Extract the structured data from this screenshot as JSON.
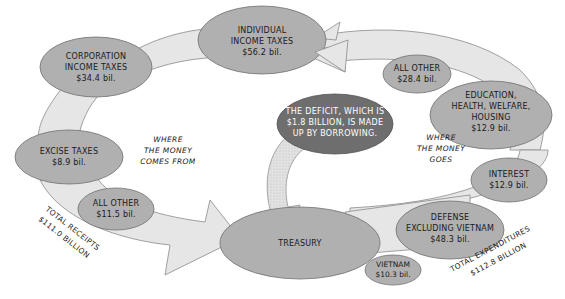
{
  "diagram": {
    "type": "flow",
    "colors": {
      "ring": "#e6e6e6",
      "ring_stroke": "#8a8a8a",
      "node_fill": "#b0b0b0",
      "node_stroke": "#707070",
      "deficit_fill": "#6e6e6e",
      "deficit_text": "#ffffff",
      "dotted_arrow": "#dcdcdc"
    },
    "receipts": {
      "heading": [
        "WHERE",
        "THE MONEY",
        "COMES FROM"
      ],
      "total": [
        "TOTAL RECEIPTS",
        "$111.0 BILLION"
      ],
      "nodes": [
        {
          "id": "corporation",
          "lines": [
            "CORPORATION",
            "INCOME TAXES",
            "$34.4 bil."
          ]
        },
        {
          "id": "individual",
          "lines": [
            "INDIVIDUAL",
            "INCOME TAXES",
            "$56.2 bil."
          ]
        },
        {
          "id": "excise",
          "lines": [
            "EXCISE TAXES",
            "$8.9 bil."
          ]
        },
        {
          "id": "all-other-receipts",
          "lines": [
            "ALL OTHER",
            "$11.5 bil."
          ]
        }
      ]
    },
    "treasury": {
      "label": "TREASURY"
    },
    "deficit": {
      "lines": [
        "THE DEFICIT, WHICH IS",
        "$1.8 BILLION, IS MADE",
        "UP BY BORROWING."
      ]
    },
    "expenditures": {
      "heading": [
        "WHERE",
        "THE MONEY",
        "GOES"
      ],
      "total": [
        "TOTAL EXPENDITURES",
        "$112.8 BILLION"
      ],
      "nodes": [
        {
          "id": "all-other-exp",
          "lines": [
            "ALL OTHER",
            "$28.4 bil."
          ]
        },
        {
          "id": "education",
          "lines": [
            "EDUCATION,",
            "HEALTH, WELFARE,",
            "HOUSING",
            "$12.9 bil."
          ]
        },
        {
          "id": "interest",
          "lines": [
            "INTEREST",
            "$12.9 bil."
          ]
        },
        {
          "id": "defense",
          "lines": [
            "DEFENSE",
            "EXCLUDING VIETNAM",
            "$48.3 bil."
          ]
        },
        {
          "id": "vietnam",
          "lines": [
            "VIETNAM",
            "$10.3 bil."
          ]
        }
      ]
    }
  }
}
